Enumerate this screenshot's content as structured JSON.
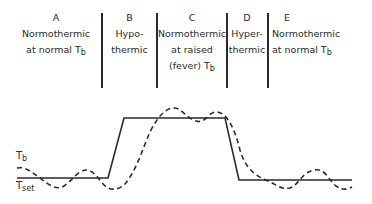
{
  "phases": [
    {
      "letter": "A",
      "line1": "Normothermic",
      "line2": "at normal T",
      "line2_sub": "b",
      "line3": ""
    },
    {
      "letter": "B",
      "line1": "Hypo-",
      "line2": "thermic",
      "line2_sub": "",
      "line3": ""
    },
    {
      "letter": "C",
      "line1": "Normothermic",
      "line2": "at raised",
      "line2_sub": "",
      "line3": "(fever) T",
      "line3_sub": "b"
    },
    {
      "letter": "D",
      "line1": "Hyper-",
      "line2": "thermic",
      "line2_sub": "",
      "line3": ""
    },
    {
      "letter": "E",
      "line1": "Normothermic",
      "line2": "at normal T",
      "line2_sub": "b",
      "line3": ""
    }
  ],
  "curves": {
    "tb_label": "T",
    "tb_sub": "b",
    "tset_label": "T",
    "tset_sub": "set",
    "tset_style": "solid",
    "tb_style": "dashed"
  }
}
